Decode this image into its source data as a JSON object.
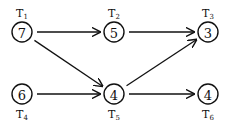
{
  "diagram": {
    "type": "task-graph",
    "nodes": [
      {
        "id": "T1",
        "label_main": "T",
        "label_sub": "1",
        "value": "7",
        "cx": 22,
        "cy": 32,
        "label_pos": "above"
      },
      {
        "id": "T2",
        "label_main": "T",
        "label_sub": "2",
        "value": "5",
        "cx": 114,
        "cy": 32,
        "label_pos": "above"
      },
      {
        "id": "T3",
        "label_main": "T",
        "label_sub": "3",
        "value": "3",
        "cx": 208,
        "cy": 32,
        "label_pos": "above"
      },
      {
        "id": "T4",
        "label_main": "T",
        "label_sub": "4",
        "value": "6",
        "cx": 22,
        "cy": 94,
        "label_pos": "below"
      },
      {
        "id": "T5",
        "label_main": "T",
        "label_sub": "5",
        "value": "4",
        "cx": 114,
        "cy": 94,
        "label_pos": "below"
      },
      {
        "id": "T6",
        "label_main": "T",
        "label_sub": "6",
        "value": "4",
        "cx": 208,
        "cy": 94,
        "label_pos": "below"
      }
    ],
    "edges": [
      {
        "from": "T1",
        "to": "T2"
      },
      {
        "from": "T2",
        "to": "T3"
      },
      {
        "from": "T1",
        "to": "T5"
      },
      {
        "from": "T4",
        "to": "T5"
      },
      {
        "from": "T5",
        "to": "T3"
      },
      {
        "from": "T5",
        "to": "T6"
      }
    ],
    "colors": {
      "stroke": "#111111",
      "background": "#ffffff"
    }
  }
}
